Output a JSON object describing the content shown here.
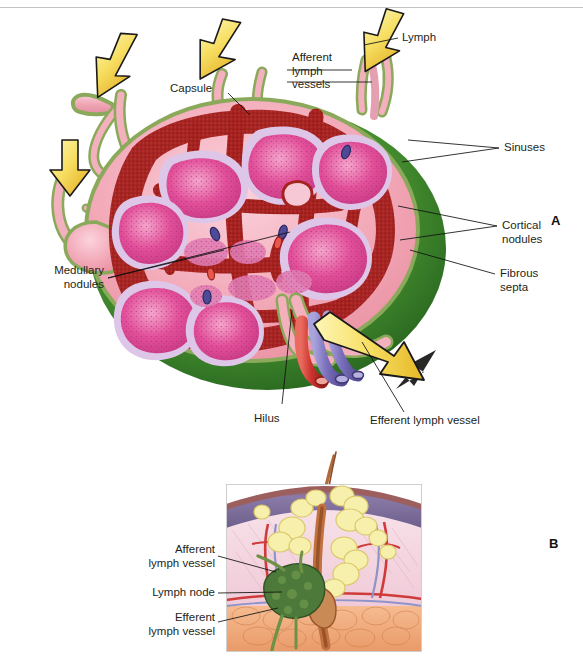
{
  "figure": {
    "background": "#ffffff",
    "width": 583,
    "height": 667,
    "panels": [
      {
        "letter": "A",
        "caption_none": ""
      },
      {
        "letter": "B",
        "caption_none": ""
      }
    ]
  },
  "panel_a": {
    "letter": "A",
    "subject": "lymph-node-cross-section",
    "labels": {
      "lymph": "Lymph",
      "afferent_lymph_vessels": "Afferent\nlymph\nvessels",
      "capsule": "Capsule",
      "sinuses": "Sinuses",
      "cortical_nodules": "Cortical\nnodules",
      "fibrous_septa": "Fibrous\nsepta",
      "medullary_nodules": "Medullary\nnodules",
      "hilus": "Hilus",
      "efferent_lymph_vessel": "Efferent lymph vessel"
    },
    "colors": {
      "capsule_green_dark": "#2f7d2a",
      "capsule_green_mid": "#4e9a36",
      "capsule_green_light": "#7fb24a",
      "cortex_pink": "#f2a7b6",
      "cortex_pink_light": "#f7c3ce",
      "sinus_dark_red": "#9e1f1f",
      "sinus_red": "#b52a26",
      "nodule_magenta": "#e2509a",
      "nodule_pink": "#ef86bb",
      "nodule_pale": "#d9c0e4",
      "vessel_green": "#8aa95a",
      "vessel_pink": "#f0a5b4",
      "artery_red": "#c7312c",
      "vein_purple": "#7a6fbc",
      "arrow_yellow": "#f6e06a",
      "arrow_gold": "#e8b92a",
      "arrow_outline": "#1a1a1a"
    },
    "arrow_count_afferent": 4,
    "arrow_count_efferent": 1
  },
  "panel_b": {
    "letter": "B",
    "subject": "skin-with-lymph-node",
    "labels": {
      "afferent_lymph_vessel": "Afferent\nlymph vessel",
      "lymph_node": "Lymph node",
      "efferent_lymph_vessel": "Efferent\nlymph vessel"
    },
    "colors": {
      "epidermis_purple": "#8a7aa8",
      "epidermis_dark": "#6d5f8c",
      "dermis_pink": "#f3d3de",
      "dermis_pink_light": "#f8e4ea",
      "hypodermis_orange": "#f0a878",
      "gland_yellow": "#f5efa8",
      "hair_brown": "#c0713f",
      "lymph_node_green": "#4d7a3a",
      "vessel_red": "#cf3b3b",
      "vessel_blue": "#8e93c8"
    }
  }
}
